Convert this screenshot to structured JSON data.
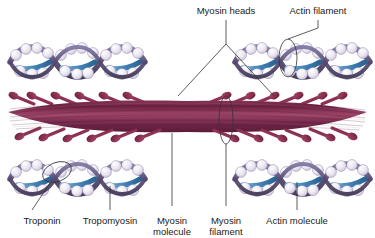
{
  "figure": {
    "title_visible": false,
    "background_color": "#ffffff"
  },
  "labels": {
    "top": [
      {
        "id": "myosin-heads",
        "text": "Myosin heads",
        "x": 226,
        "y": 14,
        "anchor": "middle"
      },
      {
        "id": "actin-filament",
        "text": "Actin filament",
        "x": 318,
        "y": 14,
        "anchor": "middle"
      }
    ],
    "bottom": [
      {
        "id": "troponin",
        "text": "Troponin",
        "x": 42,
        "y": 224,
        "anchor": "middle",
        "line2": ""
      },
      {
        "id": "tropomyosin",
        "text": "Tropomyosin",
        "x": 110,
        "y": 224,
        "anchor": "middle",
        "line2": ""
      },
      {
        "id": "myosin-molecule",
        "text": "Myosin",
        "line2": "molecule",
        "x": 172,
        "y": 224,
        "anchor": "middle"
      },
      {
        "id": "myosin-filament",
        "text": "Myosin",
        "line2": "filament",
        "x": 226,
        "y": 224,
        "anchor": "middle"
      },
      {
        "id": "actin-molecule",
        "text": "Actin molecule",
        "x": 297,
        "y": 224,
        "anchor": "middle",
        "line2": ""
      }
    ]
  },
  "colors": {
    "myosin_filament_dark": "#6e2244",
    "myosin_filament_mid": "#8c3558",
    "myosin_filament_light": "#a4496c",
    "myosin_head": "#8a2f50",
    "actin_bead_light": "#f2eef4",
    "actin_bead_shade": "#d8cfe0",
    "actin_helix_band": "#574a78",
    "actin_helix_band_light": "#8c83aa",
    "tropomyosin_blue": "#4f93c4",
    "tropomyosin_blue_dark": "#2f6d9e",
    "leader_line": "#333333",
    "text": "#1a1a1a",
    "background": "#ffffff"
  },
  "structures": {
    "actin_filaments": [
      {
        "id": "actin-top-left",
        "x": 10,
        "y": 40,
        "width": 135,
        "height": 45
      },
      {
        "id": "actin-top-right",
        "x": 235,
        "y": 40,
        "width": 135,
        "height": 45
      },
      {
        "id": "actin-bottom-left",
        "x": 10,
        "y": 157,
        "width": 135,
        "height": 45
      },
      {
        "id": "actin-bottom-right",
        "x": 235,
        "y": 157,
        "width": 135,
        "height": 45
      }
    ],
    "myosin_filament": {
      "id": "myosin-filament-body",
      "x": 8,
      "y": 100,
      "width": 360,
      "height": 40
    },
    "myosin_head_count_upper": 12,
    "myosin_head_count_lower": 12
  },
  "callouts": {
    "actin_filament_ring": {
      "cx": 288,
      "cy": 58,
      "rx": 9,
      "ry": 19
    },
    "myosin_filament_ring": {
      "cx": 226,
      "cy": 120,
      "rx": 7,
      "ry": 24
    },
    "troponin_ring": {
      "cx": 57,
      "cy": 172,
      "rx": 15,
      "ry": 10,
      "rotate": -22
    }
  }
}
